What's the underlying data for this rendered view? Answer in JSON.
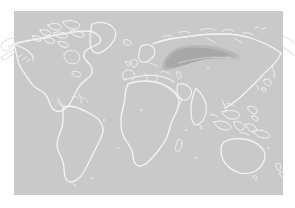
{
  "figure": {
    "kind": "world-map",
    "projection": "equirectangular",
    "title": "",
    "caption": "",
    "width": 295,
    "height": 208
  },
  "colors": {
    "page_background": "#ffffff",
    "ocean": "#c9c9c9",
    "land_fill": "#c9c9c9",
    "coastline": "#f2f2f2",
    "coastline_outside": "#e8e8e8",
    "highlight_fill": "#a8a8a8",
    "highlight_fill_soft": "#b4b4b4"
  },
  "map_frame": {
    "x": 14,
    "y": 11,
    "width": 269,
    "height": 184
  },
  "highlight": {
    "label": "",
    "region_name": "northern-eurasia",
    "shape": "tapered-ellipse",
    "center_x": 198,
    "center_y": 58,
    "extent_x_min": 163,
    "extent_x_max": 240,
    "extent_y_min": 46,
    "extent_y_max": 71
  },
  "landmasses": [
    {
      "name": "north-america"
    },
    {
      "name": "greenland"
    },
    {
      "name": "canadian-arctic-archipelago"
    },
    {
      "name": "south-america"
    },
    {
      "name": "africa"
    },
    {
      "name": "europe"
    },
    {
      "name": "asia"
    },
    {
      "name": "southeast-asia-islands"
    },
    {
      "name": "australia"
    },
    {
      "name": "new-zealand"
    },
    {
      "name": "madagascar"
    },
    {
      "name": "japan"
    },
    {
      "name": "british-isles"
    },
    {
      "name": "scandinavia"
    }
  ],
  "legend": {
    "visible": false,
    "entries": []
  },
  "axes": {
    "visible": false,
    "x_ticks": [],
    "y_ticks": []
  }
}
